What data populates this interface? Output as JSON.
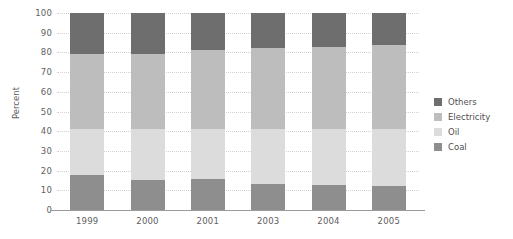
{
  "chart_data": {
    "type": "bar",
    "title": "",
    "subtitle": "",
    "xlabel": "",
    "ylabel": "Percent",
    "ylim": [
      0,
      100
    ],
    "ytick_step": 10,
    "yticks": [
      "100",
      "90",
      "80",
      "70",
      "60",
      "50",
      "40",
      "30",
      "20",
      "10",
      "0"
    ],
    "grid": true,
    "stacked": true,
    "stack_order_bottom_to_top": [
      "Coal",
      "Oil",
      "Electricity",
      "Others"
    ],
    "legend_position": "right",
    "legend": [
      "Others",
      "Electricity",
      "Oil",
      "Coal"
    ],
    "categories": [
      "1999",
      "2000",
      "2001",
      "2003",
      "2004",
      "2005"
    ],
    "series": [
      {
        "name": "Coal",
        "color": "#8e8e8e",
        "values": [
          18,
          15,
          15.5,
          13,
          12.5,
          12
        ]
      },
      {
        "name": "Oil",
        "color": "#dcdcdc",
        "values": [
          23,
          26,
          25.5,
          28,
          28.5,
          29
        ]
      },
      {
        "name": "Electricity",
        "color": "#bdbdbd",
        "values": [
          38,
          38,
          40,
          41,
          42,
          43
        ]
      },
      {
        "name": "Others",
        "color": "#6e6e6e",
        "values": [
          21,
          21,
          19,
          18,
          17,
          16
        ]
      }
    ]
  },
  "colors": {
    "others": "#6e6e6e",
    "electricity": "#bdbdbd",
    "oil": "#dcdcdc",
    "coal": "#8e8e8e",
    "grid": "#d2d2d2",
    "axis": "#9a9a9a",
    "text": "#5e5e5e",
    "background": "#ffffff"
  }
}
